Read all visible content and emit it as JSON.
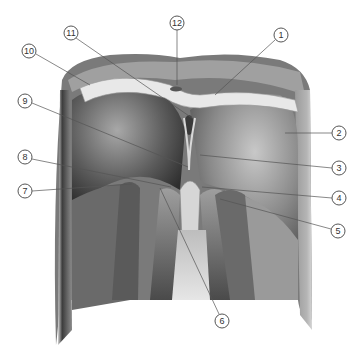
{
  "figure": {
    "colors": {
      "background": "#ffffff",
      "tendon": "#e8e8e8",
      "muscle_dark": "#3a3a3a",
      "muscle_mid": "#8a8a8a",
      "muscle_light": "#d0d0d0",
      "leader": "#555555"
    },
    "callouts": [
      {
        "n": "1",
        "x": 281,
        "y": 35,
        "tx": 215,
        "ty": 95
      },
      {
        "n": "2",
        "x": 339,
        "y": 133,
        "tx": 285,
        "ty": 133
      },
      {
        "n": "3",
        "x": 339,
        "y": 168,
        "tx": 200,
        "ty": 155
      },
      {
        "n": "4",
        "x": 339,
        "y": 198,
        "tx": 202,
        "ty": 187
      },
      {
        "n": "5",
        "x": 338,
        "y": 231,
        "tx": 220,
        "ty": 199
      },
      {
        "n": "6",
        "x": 222,
        "y": 321,
        "tx": 160,
        "ty": 188
      },
      {
        "n": "7",
        "x": 25,
        "y": 191,
        "tx": 132,
        "ty": 184
      },
      {
        "n": "8",
        "x": 25,
        "y": 157,
        "tx": 171,
        "ty": 187
      },
      {
        "n": "9",
        "x": 25,
        "y": 101,
        "tx": 188,
        "ty": 167
      },
      {
        "n": "10",
        "x": 29,
        "y": 51,
        "tx": 90,
        "ty": 85
      },
      {
        "n": "11",
        "x": 71,
        "y": 33,
        "tx": 192,
        "ty": 118
      },
      {
        "n": "12",
        "x": 177,
        "y": 23,
        "tx": 177,
        "ty": 85
      }
    ]
  }
}
